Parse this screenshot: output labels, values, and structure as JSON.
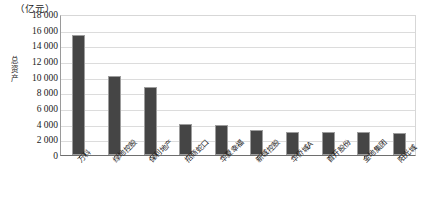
{
  "chart_data": {
    "type": "bar",
    "title": "",
    "subtitle": "",
    "unit_caption": "（亿元）",
    "ylabel": "总资产",
    "xlabel": "",
    "ylim": [
      0,
      18000
    ],
    "ytick_step": 2000,
    "yticks": [
      "0",
      "2 000",
      "4 000",
      "6 000",
      "8 000",
      "10 000",
      "12 000",
      "14 000",
      "16 000",
      "18 000"
    ],
    "ytick_values": [
      0,
      2000,
      4000,
      6000,
      8000,
      10000,
      12000,
      14000,
      16000,
      18000
    ],
    "grid": true,
    "grid_axis": "y",
    "legend": false,
    "legend_position": "none",
    "bar_color": "#454545",
    "bar_edge_color": "#9d9d9d",
    "grid_color": "#dcdcdc",
    "axis_color": "#6e6e6e",
    "categories": [
      "万科",
      "绿地控股",
      "保利地产",
      "招商蛇口",
      "华夏幸福",
      "新城控股",
      "华侨城A",
      "首开股份",
      "金地集团",
      "阳光城"
    ],
    "values": [
      15300,
      10050,
      8700,
      3900,
      3850,
      3150,
      3000,
      2950,
      2900,
      2750
    ]
  }
}
